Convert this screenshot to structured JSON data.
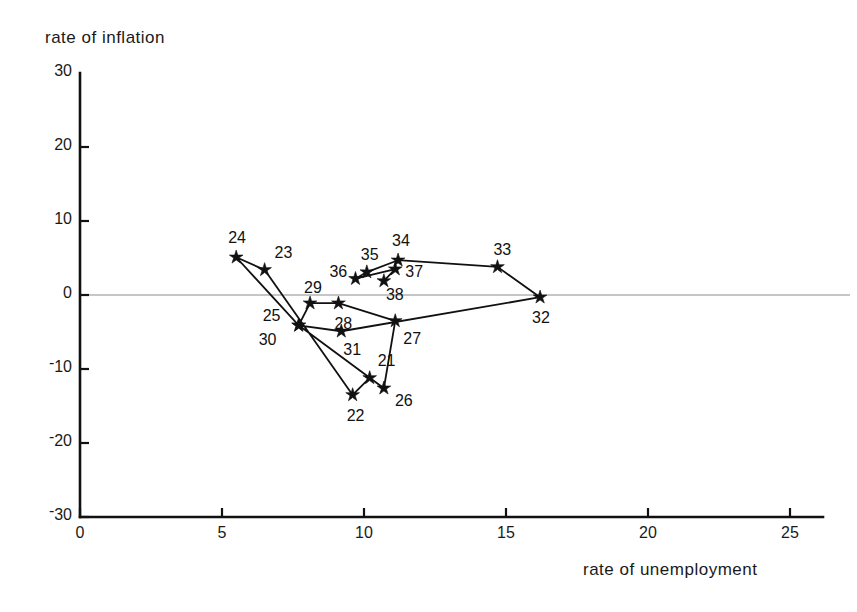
{
  "chart_data": {
    "type": "scatter",
    "title": "",
    "xlabel": "rate of unemployment",
    "ylabel": "rate of inflation",
    "xlim": [
      0,
      26.2
    ],
    "ylim": [
      -30,
      30
    ],
    "xticks": [
      "0",
      "5",
      "10",
      "15",
      "20",
      "25"
    ],
    "xtick_values": [
      0,
      5,
      10,
      15,
      20,
      25
    ],
    "yticks": [
      "30",
      "20",
      "10",
      "0",
      "-10",
      "-20",
      "-30"
    ],
    "ytick_values": [
      30,
      20,
      10,
      0,
      -10,
      -20,
      -30
    ],
    "grid": false,
    "legend": "none",
    "marker": "star",
    "connected": true,
    "zero_line": true,
    "points": [
      {
        "label": "21",
        "x": 10.2,
        "y": -11.2,
        "lx": 8,
        "ly": -26
      },
      {
        "label": "22",
        "x": 9.6,
        "y": -13.5,
        "lx": -6,
        "ly": 12
      },
      {
        "label": "23",
        "x": 6.5,
        "y": 3.4,
        "lx": 10,
        "ly": -26
      },
      {
        "label": "24",
        "x": 5.5,
        "y": 5.1,
        "lx": -8,
        "ly": -28
      },
      {
        "label": "25",
        "x": 7.7,
        "y": -4.1,
        "lx": -36,
        "ly": -18
      },
      {
        "label": "26",
        "x": 10.7,
        "y": -12.6,
        "lx": 11,
        "ly": 4
      },
      {
        "label": "27",
        "x": 11.1,
        "y": -3.5,
        "lx": 8,
        "ly": 9
      },
      {
        "label": "28",
        "x": 9.1,
        "y": -1.1,
        "lx": -4,
        "ly": 12
      },
      {
        "label": "29",
        "x": 8.1,
        "y": -1.1,
        "lx": -6,
        "ly": -24
      },
      {
        "label": "30",
        "x": 7.7,
        "y": -4.1,
        "lx": -40,
        "ly": 6
      },
      {
        "label": "31",
        "x": 9.2,
        "y": -4.9,
        "lx": 2,
        "ly": 10
      },
      {
        "label": "32",
        "x": 16.2,
        "y": -0.3,
        "lx": -8,
        "ly": 12
      },
      {
        "label": "33",
        "x": 14.7,
        "y": 3.8,
        "lx": -4,
        "ly": -26
      },
      {
        "label": "34",
        "x": 11.2,
        "y": 4.7,
        "lx": -6,
        "ly": -28
      },
      {
        "label": "35",
        "x": 10.1,
        "y": 3.1,
        "lx": -6,
        "ly": -26
      },
      {
        "label": "36",
        "x": 9.7,
        "y": 2.2,
        "lx": -26,
        "ly": -16
      },
      {
        "label": "37",
        "x": 11.1,
        "y": 3.5,
        "lx": 10,
        "ly": -6
      },
      {
        "label": "38",
        "x": 10.7,
        "y": 1.9,
        "lx": 2,
        "ly": 5
      }
    ],
    "path": [
      "21",
      "22",
      "23",
      "24",
      "25",
      "26",
      "27",
      "28",
      "29",
      "30",
      "31",
      "32",
      "33",
      "34",
      "35",
      "36",
      "37",
      "38"
    ],
    "path_order_note": "points joined sequentially 21-22-...-38"
  },
  "axes": {
    "y_axis_title": "rate of inflation",
    "x_axis_title": "rate of unemployment"
  }
}
